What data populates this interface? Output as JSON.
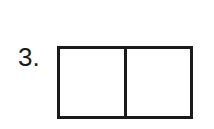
{
  "problem": {
    "number_label": "3.",
    "shape": "rectangle",
    "parts": 2,
    "divider": "vertical",
    "cells": [
      {
        "shaded": false
      },
      {
        "shaded": false
      }
    ]
  }
}
